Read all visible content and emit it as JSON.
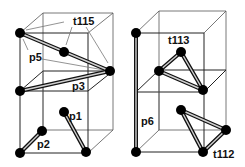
{
  "diagram": {
    "title": "",
    "left_cube": {
      "labels": {
        "t115": "t115",
        "p5": "p5",
        "p3": "p3",
        "p1": "p1",
        "p2": "p2"
      }
    },
    "right_cube": {
      "labels": {
        "t113": "t113",
        "p6": "p6",
        "t112": "t112"
      }
    },
    "colors": {
      "node": "#000000",
      "bond": "#111111",
      "bond_highlight": "#cfcfcf",
      "cube_edge": "#555555",
      "background": "#ffffff"
    }
  }
}
